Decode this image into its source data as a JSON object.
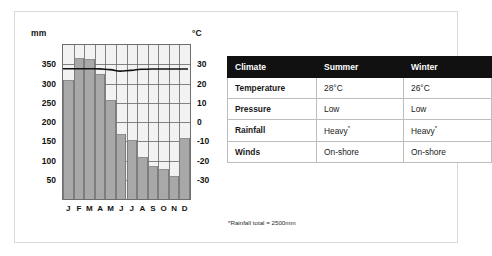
{
  "chart_data": {
    "type": "bar",
    "title": "",
    "xlabel": "",
    "ylabel": "mm",
    "y2label": "°C",
    "categories": [
      "J",
      "F",
      "M",
      "A",
      "M",
      "J",
      "J",
      "A",
      "S",
      "O",
      "N",
      "D"
    ],
    "tick_labels_left": [
      "350",
      "300",
      "250",
      "200",
      "150",
      "100",
      "50"
    ],
    "tick_labels_right": [
      "30",
      "20",
      "10",
      "0",
      "-10",
      "-20",
      "-30"
    ],
    "ylim": [
      0,
      400
    ],
    "y2lim": [
      -40,
      40
    ],
    "grid": true,
    "legend": "none",
    "series": [
      {
        "name": "Rainfall",
        "type": "bar",
        "unit": "mm",
        "axis": "left",
        "values": [
          310,
          365,
          363,
          325,
          258,
          170,
          152,
          108,
          87,
          79,
          60,
          158
        ]
      },
      {
        "name": "Temperature",
        "type": "line",
        "unit": "°C",
        "axis": "right",
        "values": [
          27.5,
          27.5,
          27.5,
          27.4,
          27.0,
          26.2,
          26.6,
          27.2,
          27.3,
          27.3,
          27.3,
          27.3
        ]
      }
    ]
  },
  "axes": {
    "left_unit": "mm",
    "right_unit": "°C"
  },
  "table": {
    "headers": [
      "Climate",
      "Summer",
      "Winter"
    ],
    "rows": [
      {
        "label": "Temperature",
        "summer": "28°C",
        "winter": "26°C"
      },
      {
        "label": "Pressure",
        "summer": "Low",
        "winter": "Low"
      },
      {
        "label": "Rainfall",
        "summer": "Heavy",
        "winter": "Heavy",
        "marker": "*"
      },
      {
        "label": "Winds",
        "summer": "On-shore",
        "winter": "On-shore"
      }
    ]
  },
  "footnote": "*Rainfall total = 2500mm",
  "colors": {
    "bar": "#a8a8a8",
    "grid": "#6e6e6e",
    "plot_bg": "#f2f2f2",
    "line": "#111111",
    "header_bg": "#111111",
    "header_text": "#ffffff",
    "frame": "#d9d9d9"
  }
}
